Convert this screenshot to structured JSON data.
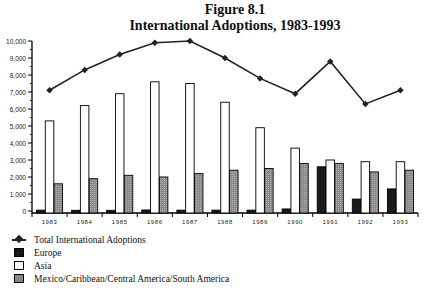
{
  "chart_data": {
    "type": "bar",
    "title": "Figure 8.1",
    "subtitle": "International Adoptions, 1983-1993",
    "xlabel": "",
    "ylabel": "",
    "ylim": [
      0,
      10000
    ],
    "yticks": [
      "0",
      "1,000",
      "2,000",
      "3,000",
      "4,000",
      "5,000",
      "6,000",
      "7,000",
      "8,000",
      "9,000",
      "10,000"
    ],
    "ytick_values": [
      0,
      1000,
      2000,
      3000,
      4000,
      5000,
      6000,
      7000,
      8000,
      9000,
      10000
    ],
    "categories": [
      "1983",
      "1984",
      "1985",
      "1986",
      "1987",
      "1988",
      "1989",
      "1990",
      "1991",
      "1992",
      "1993"
    ],
    "series": [
      {
        "name": "Total International Adoptions",
        "kind": "line",
        "color": "#222222",
        "values": [
          7100,
          8300,
          9200,
          9900,
          10000,
          9000,
          7800,
          6900,
          8800,
          6300,
          7100
        ]
      },
      {
        "name": "Europe",
        "kind": "bar",
        "color": "#1a1a1a",
        "values": [
          50,
          40,
          40,
          60,
          50,
          50,
          50,
          120,
          2600,
          700,
          1300
        ]
      },
      {
        "name": "Asia",
        "kind": "bar",
        "color": "#ffffff",
        "values": [
          5300,
          6200,
          6900,
          7600,
          7500,
          6400,
          4900,
          3700,
          3000,
          2900,
          2900
        ]
      },
      {
        "name": "Mexico/Caribbean/Central America/South America",
        "kind": "bar",
        "color": "#888888",
        "values": [
          1600,
          1900,
          2100,
          2000,
          2200,
          2400,
          2500,
          2800,
          2800,
          2300,
          2400
        ]
      }
    ],
    "legend_position": "bottom-left",
    "grid": false
  }
}
